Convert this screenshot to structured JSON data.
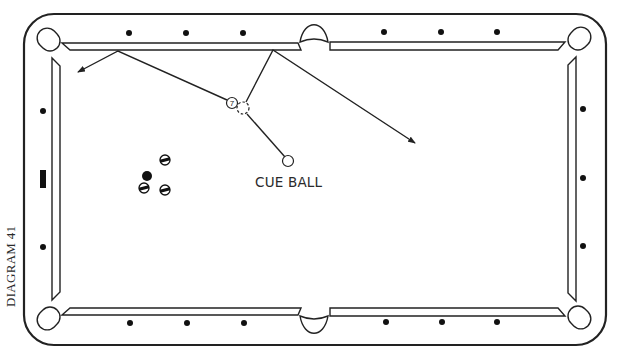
{
  "caption": "DIAGRAM 41",
  "colors": {
    "line": "#222222",
    "background": "#ffffff",
    "diamond": "#111111"
  },
  "labels": {
    "cue_ball": "CUE BALL"
  },
  "table": {
    "outer": {
      "x": 24,
      "y": 14,
      "w": 582,
      "h": 331,
      "r": 30
    },
    "cushion_inner": {
      "left": 60,
      "right": 568,
      "top": 50,
      "bottom": 308
    },
    "pockets": {
      "corner_tl": {
        "cx": 50,
        "cy": 41
      },
      "corner_tr": {
        "cx": 578,
        "cy": 40
      },
      "corner_bl": {
        "cx": 50,
        "cy": 317
      },
      "corner_br": {
        "cx": 578,
        "cy": 316
      },
      "side_top": {
        "cx": 314,
        "cy": 33
      },
      "side_bottom": {
        "cx": 314,
        "cy": 325
      }
    },
    "diamonds": {
      "top": [
        [
          129,
          33
        ],
        [
          186,
          33
        ],
        [
          243,
          33
        ],
        [
          384,
          32
        ],
        [
          441,
          32
        ],
        [
          497,
          32
        ]
      ],
      "bottom": [
        [
          130,
          323
        ],
        [
          187,
          323
        ],
        [
          244,
          323
        ],
        [
          386,
          322
        ],
        [
          442,
          322
        ],
        [
          497,
          322
        ]
      ],
      "left": [
        [
          43,
          111
        ],
        [
          43,
          247
        ]
      ],
      "right": [
        [
          583,
          109
        ],
        [
          583,
          178
        ],
        [
          583,
          246
        ]
      ]
    },
    "head_spot_marker": {
      "x": 40,
      "y": 170,
      "w": 6,
      "h": 18
    }
  },
  "balls": {
    "object_ball": {
      "number": "7",
      "cx": 232,
      "cy": 103,
      "r": 5.5
    },
    "ghost_ball": {
      "cx": 243,
      "cy": 108,
      "r": 6
    },
    "cue_ball": {
      "cx": 288,
      "cy": 161,
      "r": 5.5
    },
    "cluster": [
      {
        "type": "stripe",
        "cx": 165,
        "cy": 160,
        "r": 5
      },
      {
        "type": "solid",
        "cx": 147,
        "cy": 176,
        "r": 5
      },
      {
        "type": "stripe",
        "cx": 144,
        "cy": 188,
        "r": 5
      },
      {
        "type": "stripe",
        "cx": 165,
        "cy": 190,
        "r": 5
      }
    ]
  },
  "paths": [
    {
      "name": "object-ball-path",
      "points": [
        [
          227,
          100
        ],
        [
          118,
          51
        ],
        [
          78,
          72
        ]
      ],
      "arrow": true
    },
    {
      "name": "cue-ball-path-to-ghost",
      "points": [
        [
          285,
          157
        ],
        [
          247,
          114
        ]
      ],
      "arrow": false
    },
    {
      "name": "ghost-to-rail-path",
      "points": [
        [
          246,
          102
        ],
        [
          273,
          50
        ],
        [
          415,
          143
        ]
      ],
      "arrow": true
    }
  ]
}
